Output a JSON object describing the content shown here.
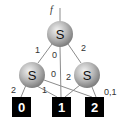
{
  "diagram": {
    "input_label": "f",
    "nodes": [
      {
        "id": "top",
        "label": "S"
      },
      {
        "id": "left",
        "label": "S"
      },
      {
        "id": "right",
        "label": "S"
      }
    ],
    "outputs": [
      {
        "id": "out0",
        "label": "0"
      },
      {
        "id": "out1",
        "label": "1"
      },
      {
        "id": "out2",
        "label": "2"
      }
    ],
    "edges": [
      {
        "from": "top",
        "to": "left",
        "label": "1"
      },
      {
        "from": "top",
        "to": "out1",
        "label": "0"
      },
      {
        "from": "top",
        "to": "right",
        "label": "2"
      },
      {
        "from": "left",
        "to": "out0",
        "label": "2"
      },
      {
        "from": "left",
        "to": "out1",
        "label": "1"
      },
      {
        "from": "left",
        "to": "out2",
        "label": "0"
      },
      {
        "from": "right",
        "to": "out1",
        "label": "2"
      },
      {
        "from": "right",
        "to": "out2",
        "label": "0,1"
      }
    ],
    "colors": {
      "line": "#888888",
      "box": "#000000",
      "sphere_light": "#e8e8e8",
      "sphere_dark": "#8a8a8a"
    }
  }
}
